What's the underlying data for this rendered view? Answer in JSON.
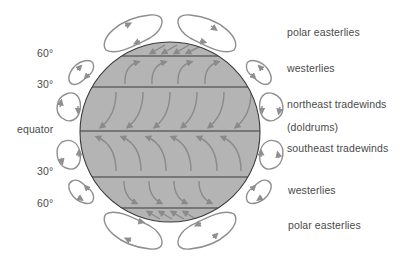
{
  "diagram": {
    "globe": {
      "cx": 170,
      "cy": 132,
      "r": 90,
      "fill": "#b4b4b4",
      "stroke": "#3a3a3a",
      "band_lines_y": [
        56,
        87,
        131,
        177,
        208
      ]
    },
    "arrow_color": "#8a8a8a",
    "loop_color": "#8f8f8f",
    "latitude_labels": [
      {
        "text": "60°",
        "x": 37,
        "y": 54
      },
      {
        "text": "30°",
        "x": 37,
        "y": 83
      },
      {
        "text": "equator",
        "x": 17,
        "y": 125
      },
      {
        "text": "30°",
        "x": 37,
        "y": 170
      },
      {
        "text": "60°",
        "x": 37,
        "y": 200
      }
    ],
    "wind_labels": [
      {
        "text": "polar easterlies",
        "x": 287,
        "y": 26
      },
      {
        "text": "westerlies",
        "x": 287,
        "y": 62
      },
      {
        "text": "northeast tradewinds",
        "x": 287,
        "y": 98
      },
      {
        "text": "(doldrums)",
        "x": 287,
        "y": 120
      },
      {
        "text": "southeast tradewinds",
        "x": 287,
        "y": 143
      },
      {
        "text": "westerlies",
        "x": 288,
        "y": 185
      },
      {
        "text": "polar easterlies",
        "x": 288,
        "y": 219
      }
    ]
  }
}
